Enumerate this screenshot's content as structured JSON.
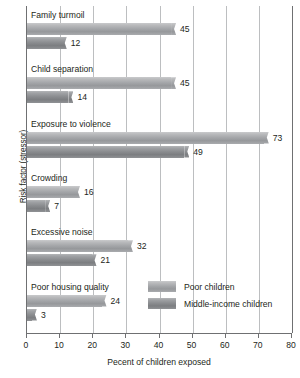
{
  "chart_data": {
    "type": "bar",
    "orientation": "horizontal",
    "title": "",
    "xlabel": "Pecent of children exposed",
    "ylabel": "Risk factor (stressor)",
    "xlim": [
      0,
      80
    ],
    "xticks": [
      0,
      10,
      20,
      30,
      40,
      50,
      60,
      70,
      80
    ],
    "grid": "vertical",
    "legend_position": "inside-lower-right",
    "categories": [
      "Family turmoil",
      "Child separation",
      "Exposure to violence",
      "Crowding",
      "Excessive noise",
      "Poor housing quality"
    ],
    "series": [
      {
        "name": "Poor children",
        "color": "#a4a6a9",
        "values": [
          45,
          45,
          73,
          16,
          32,
          24
        ]
      },
      {
        "name": "Middle-income children",
        "color": "#8a8c8f",
        "values": [
          12,
          14,
          49,
          7,
          21,
          3
        ]
      }
    ]
  },
  "legend": {
    "entries": [
      {
        "label": "Poor children"
      },
      {
        "label": "Middle-income children"
      }
    ]
  },
  "axes": {
    "x_title": "Pecent of children exposed",
    "y_title": "Risk factor (stressor)",
    "x_tick_labels": [
      "0",
      "10",
      "20",
      "30",
      "40",
      "50",
      "60",
      "70",
      "80"
    ]
  }
}
